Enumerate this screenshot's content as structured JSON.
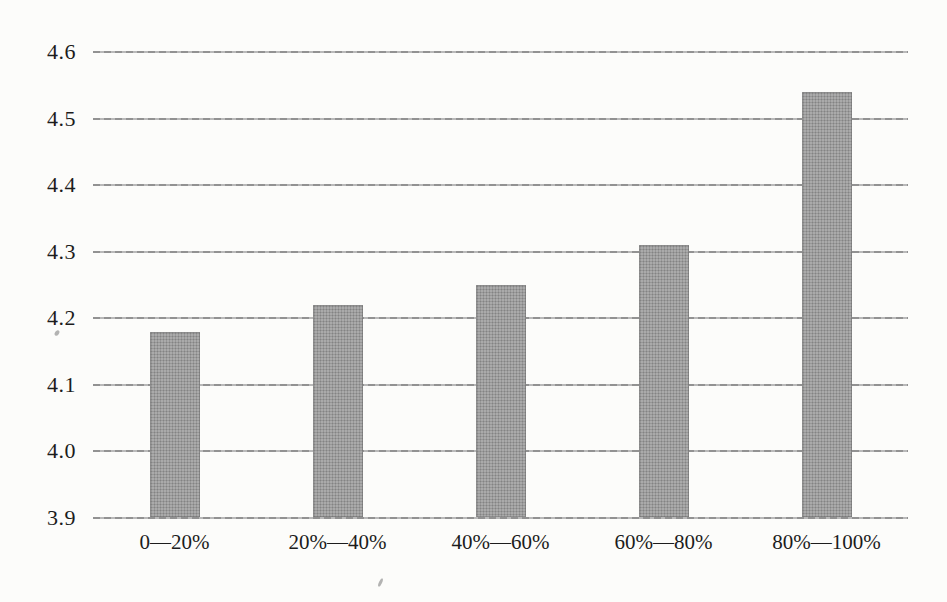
{
  "chart_data": {
    "type": "bar",
    "title": "",
    "xlabel": "",
    "ylabel": "",
    "categories": [
      "0—20%",
      "20%—40%",
      "40%—60%",
      "60%—80%",
      "80%—100%"
    ],
    "values": [
      4.18,
      4.22,
      4.25,
      4.31,
      4.54
    ],
    "ylim": [
      3.9,
      4.6
    ],
    "ytick_step": 0.1,
    "yticks": [
      "3.9",
      "4.0",
      "4.1",
      "4.2",
      "4.3",
      "4.4",
      "4.5",
      "4.6"
    ],
    "grid": true,
    "legend_position": "none",
    "bar_color": "#aaaaaa",
    "gridline_color": "#b3b3b3",
    "background_color": "#fcfcfa",
    "text_color": "#1c1c1c"
  }
}
